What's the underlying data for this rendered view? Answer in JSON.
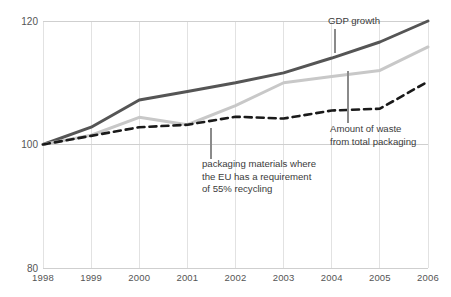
{
  "chart_data": {
    "type": "line",
    "title": "",
    "subtitle": "",
    "xlabel": "",
    "ylabel": "",
    "x": [
      1998,
      1999,
      2000,
      2001,
      2002,
      2003,
      2004,
      2005,
      2006
    ],
    "categories": [
      "1998",
      "1999",
      "2000",
      "2001",
      "2002",
      "2003",
      "2004",
      "2005",
      "2006"
    ],
    "xlim": [
      1998,
      2006
    ],
    "ylim": [
      80,
      120
    ],
    "y_ticks": [
      80,
      100,
      120
    ],
    "y_tick_labels": [
      "80",
      "100",
      "120"
    ],
    "grid": "vertical",
    "legend": "annotations",
    "series": [
      {
        "name": "GDP growth",
        "color": "#555555",
        "style": "solid",
        "width": 3,
        "values": [
          100.0,
          102.8,
          107.2,
          108.6,
          110.0,
          111.6,
          114.0,
          116.6,
          120.0
        ]
      },
      {
        "name": "packaging materials where the EU has a requirement of 55% recycling",
        "color": "#c8c8c8",
        "style": "solid",
        "width": 3,
        "values": [
          100.0,
          101.5,
          104.4,
          103.2,
          106.3,
          110.0,
          111.0,
          112.0,
          115.8
        ]
      },
      {
        "name": "Amount of waste from total packaging",
        "color": "#1a1a1a",
        "style": "dashed",
        "width": 2.6,
        "values": [
          100.0,
          101.4,
          102.8,
          103.2,
          104.5,
          104.2,
          105.5,
          105.8,
          110.2
        ]
      }
    ],
    "annotations": [
      {
        "id": "gdp-growth",
        "lines": [
          "GDP growth"
        ],
        "text_x": 328,
        "text_y": 24,
        "anchor": "start",
        "leader": {
          "x1": 335,
          "y1": 29,
          "x2": 335,
          "y2": 53
        }
      },
      {
        "id": "packaging-materials",
        "lines": [
          "packaging materials where",
          "the EU has a requirement",
          "of 55% recycling"
        ],
        "text_x": 202,
        "text_y": 167,
        "anchor": "start",
        "leader": {
          "x1": 211,
          "y1": 128,
          "x2": 211,
          "y2": 159
        }
      },
      {
        "id": "amount-of-waste",
        "lines": [
          "Amount of waste",
          "from total packaging"
        ],
        "text_x": 330,
        "text_y": 132,
        "anchor": "start",
        "leader": {
          "x1": 348,
          "y1": 71,
          "x2": 348,
          "y2": 123
        }
      }
    ],
    "colors": {
      "background": "#ffffff",
      "grid": "#e2e2e2",
      "axis": "#cfcfcf",
      "tick_text": "#555555",
      "annotation_text": "#3b3b3b",
      "gdp_line": "#555555",
      "packaging_line": "#c8c8c8",
      "waste_line": "#1a1a1a"
    }
  },
  "geometry": {
    "plot_left": 43,
    "plot_right": 428,
    "plot_top": 21,
    "plot_bottom": 268,
    "y_label_x": 38,
    "x_label_y": 281
  }
}
